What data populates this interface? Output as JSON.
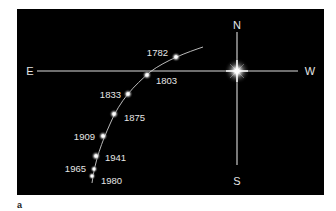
{
  "figure": {
    "panel_label": "a",
    "background_color": "#000000",
    "line_color": "#e6e6e6",
    "text_color": "#e6e6e6"
  },
  "compass": {
    "north": "N",
    "south": "S",
    "east": "E",
    "west": "W",
    "center_star": "pole-star-glow"
  },
  "path": {
    "points": [
      {
        "year": "1782",
        "label_side": "left"
      },
      {
        "year": "1803",
        "label_side": "right"
      },
      {
        "year": "1833",
        "label_side": "left"
      },
      {
        "year": "1875",
        "label_side": "right"
      },
      {
        "year": "1909",
        "label_side": "left"
      },
      {
        "year": "1941",
        "label_side": "right"
      },
      {
        "year": "1965",
        "label_side": "left"
      },
      {
        "year": "1980",
        "label_side": "right"
      }
    ]
  }
}
